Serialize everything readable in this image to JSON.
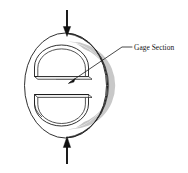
{
  "figure": {
    "name": "brazilian-disk-compact-tension-specimen",
    "background_color": "#ffffff",
    "line_color": "#1a1a1a",
    "shade_color": "#8c8c8c"
  },
  "annotations": [
    {
      "id": "gage-section",
      "label": "Gage Section",
      "leader": {
        "text_anchor_x": 132,
        "text_anchor_y": 47,
        "elbow_x": 122,
        "elbow_y": 47,
        "tip_x": 69,
        "tip_y": 83
      }
    }
  ],
  "load_arrows": [
    {
      "id": "top-load-arrow",
      "direction": "down",
      "x": 67,
      "tail_y": 10,
      "head_y": 35,
      "label": ""
    },
    {
      "id": "bottom-load-arrow",
      "direction": "up",
      "x": 67,
      "tail_y": 164,
      "head_y": 138,
      "label": ""
    }
  ],
  "geometry": {
    "disk_center_x": 67,
    "disk_center_y": 85.5,
    "disk_radius": 44,
    "slot_count": 2,
    "slot_labels": [
      "upper-slot",
      "lower-slot"
    ]
  }
}
